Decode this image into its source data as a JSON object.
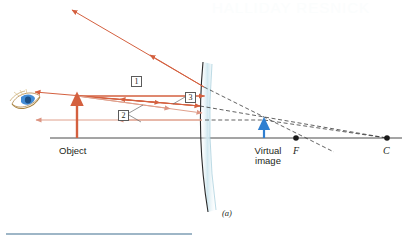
{
  "figure": {
    "panel_label": "(a)",
    "type": "convex-mirror-ray-diagram",
    "watermark": "HALLIDAY RESNICK"
  },
  "labels": {
    "object": "Object",
    "virtual_image_line1": "Virtual",
    "virtual_image_line2": "image",
    "focal_point": "F",
    "center_of_curvature": "C"
  },
  "rays": {
    "ray1": "1",
    "ray2": "2",
    "ray3": "3"
  },
  "colors": {
    "ray": "#d4603f",
    "ray_light": "#e0a08c",
    "mirror_stroke": "#2a2a2a",
    "mirror_fill": "#bfdfe8",
    "axis": "#4a4a4a",
    "dashed": "#3a3a3a",
    "image_arrow": "#2f7fd0",
    "object_arrow": "#d4603f",
    "text": "#231f20"
  },
  "geometry": {
    "axis_y": 138,
    "object_x": 77,
    "object_top_y": 96,
    "mirror_vertex_x": 210,
    "virtual_image_x": 264,
    "virtual_image_top_y": 120,
    "focal_point_x": 296,
    "center_x": 387,
    "eye_x": 22,
    "eye_y": 104
  },
  "elements": {
    "eye_icon": "eye-icon",
    "mirror": "convex-mirror",
    "optical_axis": "optical-axis",
    "object_arrow": "object-arrow",
    "virtual_image_arrow": "virtual-image-arrow",
    "caption_rule": "caption-divider"
  }
}
